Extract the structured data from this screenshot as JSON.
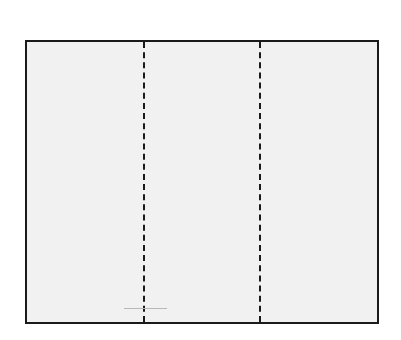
{
  "diagram": {
    "type": "trifold-panel",
    "panels": 3,
    "fold_lines": [
      {
        "style": "dashed",
        "position": "one-third"
      },
      {
        "style": "dashed",
        "position": "two-thirds"
      }
    ],
    "colors": {
      "background": "#ffffff",
      "panel_fill": "#f1f1f1",
      "border": "#1a1a1a",
      "faint_mark": "#b8b8b8"
    }
  }
}
